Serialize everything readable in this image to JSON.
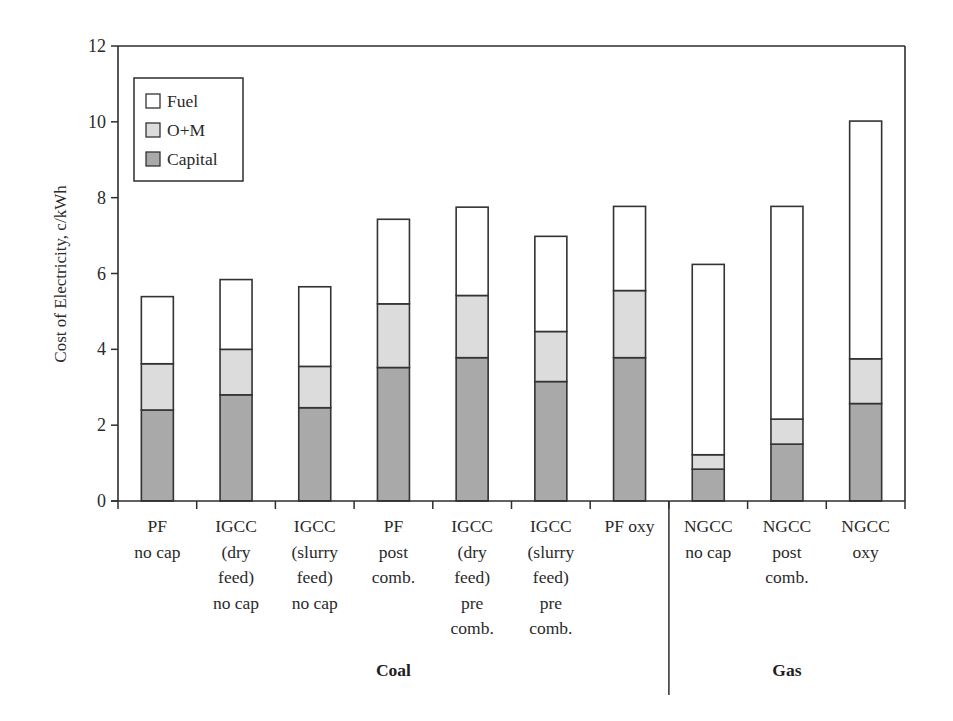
{
  "chart_data": {
    "type": "bar",
    "stacked": true,
    "title": "",
    "xlabel": "",
    "ylabel": "Cost of Electricity, c/kWh",
    "ylim": [
      0,
      12
    ],
    "yticks": [
      0,
      2,
      4,
      6,
      8,
      10,
      12
    ],
    "grid": false,
    "legend_position": "upper-left (inside)",
    "categories": [
      [
        "PF",
        "no cap"
      ],
      [
        "IGCC",
        "(dry",
        "feed)",
        "no cap"
      ],
      [
        "IGCC",
        "(slurry",
        "feed)",
        "no cap"
      ],
      [
        "PF",
        "post",
        "comb."
      ],
      [
        "IGCC",
        "(dry",
        "feed)",
        "pre",
        "comb."
      ],
      [
        "IGCC",
        "(slurry",
        "feed)",
        "pre",
        "comb."
      ],
      [
        "PF oxy"
      ],
      [
        "NGCC",
        "no cap"
      ],
      [
        "NGCC",
        "post",
        "comb."
      ],
      [
        "NGCC",
        "oxy"
      ]
    ],
    "category_names": [
      "PF no cap",
      "IGCC (dry feed) no cap",
      "IGCC (slurry feed) no cap",
      "PF post comb.",
      "IGCC (dry feed) pre comb.",
      "IGCC (slurry feed) pre comb.",
      "PF oxy",
      "NGCC no cap",
      "NGCC post comb.",
      "NGCC oxy"
    ],
    "groups": [
      {
        "label": "Coal",
        "start": 0,
        "end": 6
      },
      {
        "label": "Gas",
        "start": 7,
        "end": 9
      }
    ],
    "series": [
      {
        "name": "Capital",
        "color": "#a9a9a9",
        "values": [
          2.4,
          2.8,
          2.46,
          3.52,
          3.78,
          3.15,
          3.78,
          0.84,
          1.5,
          2.57
        ]
      },
      {
        "name": "O+M",
        "color": "#dcdcdc",
        "values": [
          1.22,
          1.2,
          1.09,
          1.68,
          1.64,
          1.32,
          1.77,
          0.38,
          0.66,
          1.18
        ]
      },
      {
        "name": "Fuel",
        "color": "#ffffff",
        "values": [
          1.77,
          1.84,
          2.1,
          2.23,
          2.33,
          2.51,
          2.22,
          5.02,
          5.61,
          6.27
        ]
      }
    ],
    "totals": [
      5.39,
      5.84,
      5.65,
      7.43,
      7.75,
      6.98,
      7.77,
      6.24,
      7.77,
      10.02
    ]
  },
  "legend": {
    "items": [
      {
        "label": "Fuel",
        "color": "#ffffff"
      },
      {
        "label": "O+M",
        "color": "#dcdcdc"
      },
      {
        "label": "Capital",
        "color": "#a9a9a9"
      }
    ]
  },
  "colors": {
    "outline": "#333333",
    "axis": "#2e2e2e"
  }
}
